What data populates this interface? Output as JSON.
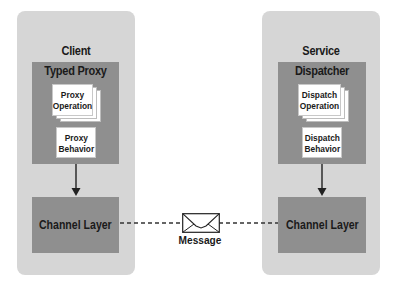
{
  "client": {
    "title": "Client",
    "proxy_box_title": "Typed Proxy",
    "operation_card": [
      "Proxy",
      "Operation"
    ],
    "behavior_card": [
      "Proxy",
      "Behavior"
    ],
    "channel_label": "Channel Layer"
  },
  "service": {
    "title": "Service",
    "dispatcher_box_title": "Dispatcher",
    "operation_card": [
      "Dispatch",
      "Operation"
    ],
    "behavior_card": [
      "Dispatch",
      "Behavior"
    ],
    "channel_label": "Channel Layer"
  },
  "message": {
    "label": "Message",
    "icon": "envelope-icon"
  },
  "colors": {
    "outer_box": "#d6d6d6",
    "inner_box": "#8f8f8f",
    "card": "#ffffff",
    "text": "#1a1a1a",
    "connector": "#333333"
  }
}
